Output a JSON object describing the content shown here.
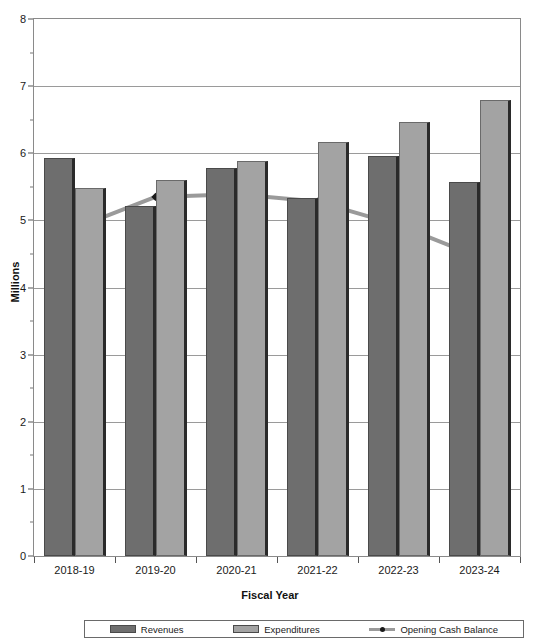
{
  "chart_data": {
    "type": "bar",
    "title": "With Reductions and Bonds",
    "xlabel": "Fiscal Year",
    "ylabel": "Millions",
    "categories": [
      "2018-19",
      "2019-20",
      "2020-21",
      "2021-22",
      "2022-23",
      "2023-24"
    ],
    "ylim": [
      0,
      8
    ],
    "yticks": [
      0,
      1,
      2,
      3,
      4,
      5,
      6,
      7,
      8
    ],
    "ytick_labels": [
      "0",
      "1",
      "2",
      "3",
      "4",
      "5",
      "6",
      "7",
      "8"
    ],
    "grid": true,
    "legend_position": "bottom",
    "series": [
      {
        "name": "Revenues",
        "type": "bar",
        "color": "#6e6e6e",
        "values": [
          5.93,
          5.22,
          5.78,
          5.33,
          5.96,
          5.57
        ]
      },
      {
        "name": "Expenditures",
        "type": "bar",
        "color": "#a3a3a3",
        "values": [
          5.48,
          5.6,
          5.89,
          6.17,
          6.47,
          6.79
        ]
      },
      {
        "name": "Opening Cash Balance",
        "type": "line",
        "color": "#9a9a9a",
        "marker_color": "#1a1a1a",
        "values": [
          4.88,
          5.35,
          5.39,
          5.28,
          4.93,
          4.45
        ]
      }
    ]
  },
  "legend": {
    "items": [
      {
        "label": "Revenues",
        "swatch": "rev"
      },
      {
        "label": "Expenditures",
        "swatch": "exp"
      },
      {
        "label": "Opening Cash Balance",
        "swatch": "line"
      }
    ]
  }
}
